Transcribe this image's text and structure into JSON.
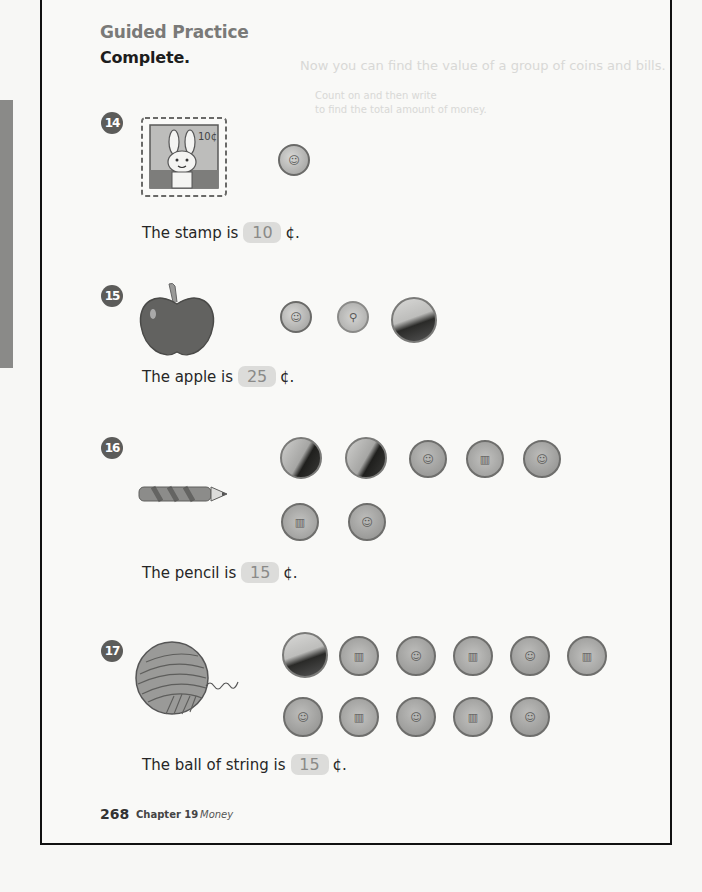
{
  "page": {
    "section_title": "Guided Practice",
    "instruction": "Complete.",
    "bleed_through": [
      "Now you can find the value of a group of coins and bills.",
      "Count on and then write",
      "to find the total amount of money."
    ]
  },
  "problems": [
    {
      "number": "14",
      "item": "stamp",
      "item_label": "10¢",
      "sentence_prefix": "The stamp is",
      "answer": "10",
      "unit": "¢.",
      "coins": [
        {
          "type": "dime",
          "side": "heads"
        }
      ]
    },
    {
      "number": "15",
      "item": "apple",
      "sentence_prefix": "The apple is",
      "answer": "25",
      "unit": "¢.",
      "coins": [
        {
          "type": "dime",
          "side": "heads"
        },
        {
          "type": "dime",
          "side": "tails"
        },
        {
          "type": "nickel",
          "side": "tails"
        }
      ]
    },
    {
      "number": "16",
      "item": "pencil",
      "sentence_prefix": "The pencil is",
      "answer": "15",
      "unit": "¢.",
      "coins": [
        {
          "type": "nickel",
          "side": "heads"
        },
        {
          "type": "nickel",
          "side": "heads"
        },
        {
          "type": "penny",
          "side": "heads"
        },
        {
          "type": "penny",
          "side": "tails"
        },
        {
          "type": "penny",
          "side": "heads"
        },
        {
          "type": "penny",
          "side": "tails"
        },
        {
          "type": "penny",
          "side": "heads"
        }
      ]
    },
    {
      "number": "17",
      "item": "ball of string",
      "sentence_prefix": "The ball of string is",
      "answer": "15",
      "unit": "¢.",
      "coins": [
        {
          "type": "nickel",
          "side": "tails"
        },
        {
          "type": "penny",
          "side": "tails"
        },
        {
          "type": "penny",
          "side": "heads"
        },
        {
          "type": "penny",
          "side": "tails"
        },
        {
          "type": "penny",
          "side": "heads"
        },
        {
          "type": "penny",
          "side": "tails"
        },
        {
          "type": "penny",
          "side": "heads"
        },
        {
          "type": "penny",
          "side": "tails"
        },
        {
          "type": "penny",
          "side": "heads"
        },
        {
          "type": "penny",
          "side": "tails"
        },
        {
          "type": "penny",
          "side": "heads"
        }
      ]
    }
  ],
  "footer": {
    "page_number": "268",
    "chapter": "Chapter 19",
    "topic": "Money"
  },
  "colors": {
    "badge": "#5c5c5a",
    "answer_box": "#dcdcda",
    "frame": "#111111",
    "section_title": "#7a7a78"
  }
}
